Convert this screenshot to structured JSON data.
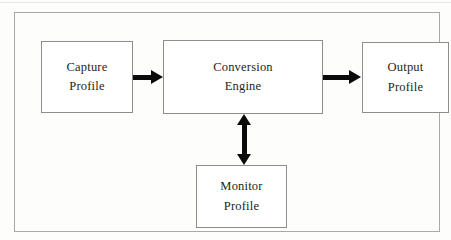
{
  "figure": {
    "type": "block-flow-diagram",
    "background_color": "#fdfdfc",
    "frame_border_color": "#a9a9a6",
    "box_border_color": "#8d8d8a",
    "box_fill_color": "#ffffff",
    "text_color": "#221f1d",
    "arrow_color": "#0b0b0b"
  },
  "nodes": {
    "capture": {
      "line1": "Capture",
      "line2": "Profile"
    },
    "conversion": {
      "line1": "Conversion",
      "line2": "Engine"
    },
    "output": {
      "line1": "Output",
      "line2": "Profile"
    },
    "monitor": {
      "line1": "Monitor",
      "line2": "Profile"
    }
  },
  "connectors": [
    {
      "name": "capture-to-conversion",
      "from": "capture",
      "to": "conversion",
      "direction": "right",
      "heads": 1
    },
    {
      "name": "conversion-to-output",
      "from": "conversion",
      "to": "output",
      "direction": "right",
      "heads": 1
    },
    {
      "name": "conversion-monitor",
      "from": "conversion",
      "to": "monitor",
      "direction": "vertical-bidirectional",
      "heads": 2
    }
  ]
}
